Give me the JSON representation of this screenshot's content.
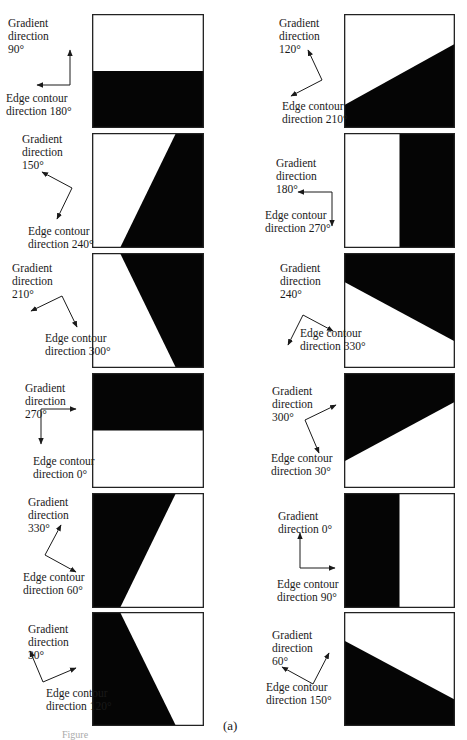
{
  "figure": {
    "sublabel": "(a)",
    "caption_fragment": "Figure",
    "colors": {
      "dark": "#050505",
      "light": "#ffffff",
      "border": "#222222",
      "text": "#1a1a1a"
    },
    "panels": [
      {
        "id": "L1",
        "col": "left",
        "row": 1,
        "gradient_label": [
          "Gradient",
          "direction",
          "90°"
        ],
        "edge_label": [
          "Edge contour",
          "direction 180°"
        ],
        "gradient_deg": 90,
        "edge_deg": 180,
        "dark_polygon": "0,50 100,50 100,100 0,100"
      },
      {
        "id": "R1",
        "col": "right",
        "row": 1,
        "gradient_label": [
          "Gradient",
          "direction",
          "120°"
        ],
        "edge_label": [
          "Edge contour",
          "direction 210°"
        ],
        "gradient_deg": 120,
        "edge_deg": 210,
        "dark_polygon": "0,80 100,26 100,100 0,100"
      },
      {
        "id": "L2",
        "col": "left",
        "row": 2,
        "gradient_label": [
          "Gradient",
          "direction",
          "150°"
        ],
        "edge_label": [
          "Edge contour",
          "direction 240°"
        ],
        "gradient_deg": 150,
        "edge_deg": 240,
        "dark_polygon": "75,0 100,0 100,100 25,100"
      },
      {
        "id": "R2",
        "col": "right",
        "row": 2,
        "gradient_label": [
          "Gradient",
          "direction",
          "180°"
        ],
        "edge_label": [
          "Edge contour",
          "direction 270°"
        ],
        "gradient_deg": 180,
        "edge_deg": 270,
        "dark_polygon": "50,0 100,0 100,100 50,100"
      },
      {
        "id": "L3",
        "col": "left",
        "row": 3,
        "gradient_label": [
          "Gradient",
          "direction",
          "210°"
        ],
        "edge_label": [
          "Edge contour",
          "direction 300°"
        ],
        "gradient_deg": 210,
        "edge_deg": 300,
        "dark_polygon": "25,0 100,0 100,100 75,100"
      },
      {
        "id": "R3",
        "col": "right",
        "row": 3,
        "gradient_label": [
          "Gradient",
          "direction",
          "240°"
        ],
        "edge_label": [
          "Edge contour",
          "direction 330°"
        ],
        "gradient_deg": 240,
        "edge_deg": 330,
        "dark_polygon": "0,0 100,0 100,77 0,25"
      },
      {
        "id": "L4",
        "col": "left",
        "row": 4,
        "gradient_label": [
          "Gradient",
          "direction",
          "270°"
        ],
        "edge_label": [
          "Edge contour",
          "direction 0°"
        ],
        "gradient_deg": 270,
        "edge_deg": 0,
        "dark_polygon": "0,0 100,0 100,50 0,50"
      },
      {
        "id": "R4",
        "col": "right",
        "row": 4,
        "gradient_label": [
          "Gradient",
          "direction",
          "300°"
        ],
        "edge_label": [
          "Edge contour",
          "direction 30°"
        ],
        "gradient_deg": 300,
        "edge_deg": 30,
        "dark_polygon": "0,0 100,0 100,25 0,77"
      },
      {
        "id": "L5",
        "col": "left",
        "row": 5,
        "gradient_label": [
          "Gradient",
          "direction",
          "330°"
        ],
        "edge_label": [
          "Edge contour",
          "direction 60°"
        ],
        "gradient_deg": 330,
        "edge_deg": 60,
        "dark_polygon": "0,0 75,0 25,100 0,100"
      },
      {
        "id": "R5",
        "col": "right",
        "row": 5,
        "gradient_label": [
          "Gradient",
          "direction 0°"
        ],
        "edge_label": [
          "Edge contour",
          "direction 90°"
        ],
        "gradient_deg": 0,
        "edge_deg": 90,
        "dark_polygon": "0,0 50,0 50,100 0,100"
      },
      {
        "id": "L6",
        "col": "left",
        "row": 6,
        "gradient_label": [
          "Gradient",
          "direction",
          "30°"
        ],
        "edge_label": [
          "Edge contour",
          "direction 120°"
        ],
        "gradient_deg": 30,
        "edge_deg": 120,
        "dark_polygon": "0,0 25,0 75,100 0,100"
      },
      {
        "id": "R6",
        "col": "right",
        "row": 6,
        "gradient_label": [
          "Gradient",
          "direction",
          "60°"
        ],
        "edge_label": [
          "Edge contour",
          "direction 150°"
        ],
        "gradient_deg": 60,
        "edge_deg": 150,
        "dark_polygon": "0,25 100,77 100,100 0,100"
      }
    ]
  }
}
